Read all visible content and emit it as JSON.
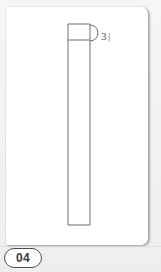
{
  "document": {
    "background_color": "#f1f1f1",
    "card_color": "#ffffff"
  },
  "figure": {
    "badge_label": "04",
    "badge_name": "figure-number-04",
    "caption_present": false
  },
  "drawing": {
    "title": "Elongated rectangular element with top crossbar and side lobe",
    "line_color": "#6d6d6d",
    "line_width": 1,
    "elements": [
      {
        "name": "main-body-rectangle",
        "type": "rectangle",
        "x": 62,
        "y": 17,
        "width": 22,
        "height": 201
      },
      {
        "name": "top-crossbar",
        "type": "line",
        "x1": 62,
        "y1": 33,
        "x2": 84,
        "y2": 33
      },
      {
        "name": "side-lobe-arc",
        "type": "arc",
        "cx": 84,
        "cy": 26,
        "radius": 8,
        "description": "semicircular lobe bulging right from upper right edge"
      }
    ]
  },
  "annotations": {
    "reference_numeral": "3",
    "reference_tick": "|",
    "leader_from": "side-lobe-arc",
    "text_color": "#545454"
  }
}
